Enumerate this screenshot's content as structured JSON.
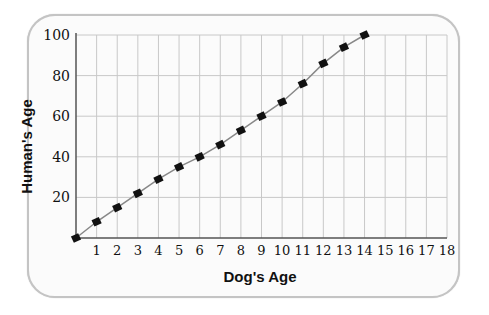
{
  "chart_data": {
    "type": "line",
    "title": "",
    "xlabel": "Dog's Age",
    "ylabel": "Human's Age",
    "x": [
      0,
      1,
      2,
      3,
      4,
      5,
      6,
      7,
      8,
      9,
      10,
      11,
      12,
      13,
      14
    ],
    "series": [
      {
        "name": "Human's Age",
        "values": [
          0,
          8,
          15,
          22,
          29,
          35,
          40,
          46,
          53,
          60,
          67,
          76,
          86,
          94,
          100
        ]
      }
    ],
    "xlim": [
      0,
      18
    ],
    "ylim": [
      0,
      100
    ],
    "xticks": [
      "1",
      "2",
      "3",
      "4",
      "5",
      "6",
      "7",
      "8",
      "9",
      "10",
      "11",
      "12",
      "13",
      "14",
      "15",
      "16",
      "17",
      "18"
    ],
    "yticks": [
      "20",
      "40",
      "60",
      "80",
      "100"
    ],
    "grid": true,
    "legend": null,
    "marker": "square",
    "colors": {
      "line": "#888888",
      "marker": "#111111",
      "grid": "#c8c8c8",
      "axis": "#555555",
      "frame": "#c4c4c4"
    }
  }
}
